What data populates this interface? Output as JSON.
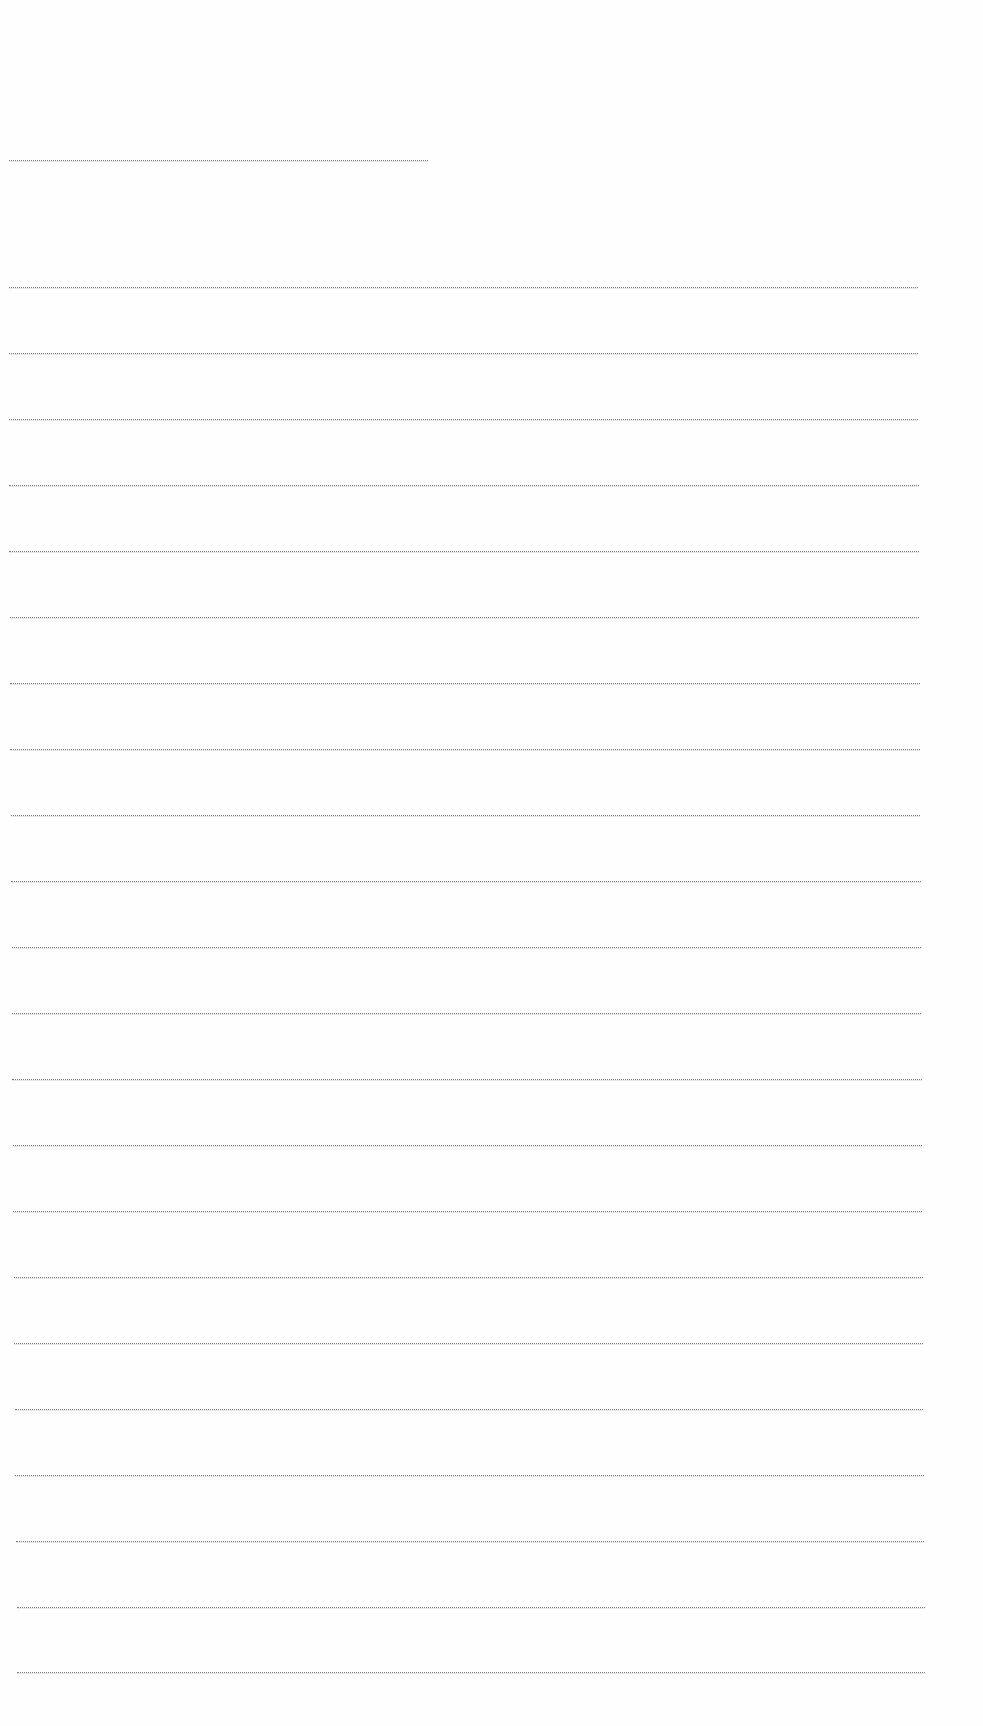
{
  "document": {
    "type": "blank lined sheet",
    "background_color": "#fefefe",
    "line_color": "#7a7a7a",
    "short_line": {
      "x1": 9,
      "x2": 428,
      "y": 160
    },
    "lines": [
      {
        "x1": 9,
        "x2": 918,
        "y": 287
      },
      {
        "x1": 9,
        "x2": 918,
        "y": 353
      },
      {
        "x1": 9,
        "x2": 918,
        "y": 419
      },
      {
        "x1": 9,
        "x2": 919,
        "y": 485
      },
      {
        "x1": 9,
        "x2": 919,
        "y": 551
      },
      {
        "x1": 10,
        "x2": 919,
        "y": 617
      },
      {
        "x1": 10,
        "x2": 920,
        "y": 683
      },
      {
        "x1": 10,
        "x2": 920,
        "y": 749
      },
      {
        "x1": 11,
        "x2": 920,
        "y": 815
      },
      {
        "x1": 11,
        "x2": 921,
        "y": 881
      },
      {
        "x1": 12,
        "x2": 921,
        "y": 947
      },
      {
        "x1": 12,
        "x2": 921,
        "y": 1013
      },
      {
        "x1": 12,
        "x2": 922,
        "y": 1079
      },
      {
        "x1": 13,
        "x2": 922,
        "y": 1145
      },
      {
        "x1": 13,
        "x2": 922,
        "y": 1211
      },
      {
        "x1": 14,
        "x2": 923,
        "y": 1277
      },
      {
        "x1": 14,
        "x2": 923,
        "y": 1343
      },
      {
        "x1": 15,
        "x2": 923,
        "y": 1409
      },
      {
        "x1": 15,
        "x2": 924,
        "y": 1475
      },
      {
        "x1": 16,
        "x2": 924,
        "y": 1541
      },
      {
        "x1": 17,
        "x2": 925,
        "y": 1607
      },
      {
        "x1": 17,
        "x2": 925,
        "y": 1672
      }
    ]
  }
}
